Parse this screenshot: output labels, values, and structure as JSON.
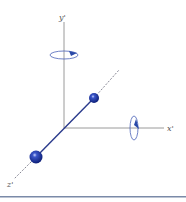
{
  "diagram": {
    "type": "rotating-axes-3d",
    "axes": {
      "y_label": "y'",
      "x_label": "x'",
      "z_label": "z'"
    },
    "rotations": [
      {
        "axis": "y'",
        "description": "rotation arrow around y' axis"
      },
      {
        "axis": "x'",
        "description": "rotation arrow around x' axis"
      }
    ],
    "masses": [
      {
        "position": "on z' axis, near end (front)",
        "size": "large"
      },
      {
        "position": "on z' axis, far end (back)",
        "size": "small"
      }
    ]
  },
  "colors": {
    "axis": "#9a9a9a",
    "rod": "#2a3a8c",
    "sphere": "#1a33a0",
    "arrow": "#2a4aa8",
    "bottom_rule": "#7a8aa8"
  }
}
